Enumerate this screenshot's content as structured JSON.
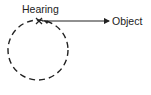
{
  "diagram": {
    "labels": {
      "hearing": "Hearing",
      "object": "Object"
    },
    "marker": "X",
    "colors": {
      "stroke": "#222222",
      "background": "#ffffff"
    },
    "circle": {
      "cx": 38,
      "cy": 50,
      "r": 30,
      "style": "dashed"
    },
    "arrow": {
      "from": [
        41,
        21
      ],
      "to": [
        110,
        21
      ]
    }
  }
}
